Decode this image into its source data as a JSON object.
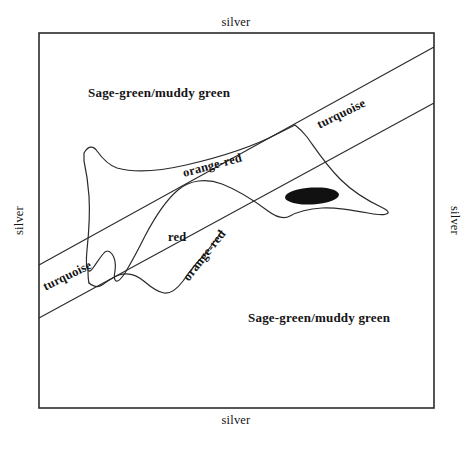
{
  "figure": {
    "background_color": "#ffffff",
    "ink_color": "#141414",
    "frame": {
      "name": "outer-frame",
      "x": 39,
      "y": 33,
      "width": 395,
      "height": 375,
      "stroke_color": "#2b2b2b",
      "stroke_width": 1.6,
      "fill": "none"
    }
  },
  "edge_labels": {
    "top": "silver",
    "bottom": "silver",
    "left": "silver",
    "right": "silver"
  },
  "regions": {
    "sage_top": "Sage-green/muddy green",
    "sage_bottom": "Sage-green/muddy green",
    "turquoise_top": "turquoise",
    "turquoise_bottom": "turquoise",
    "orange_red_top": "orange-red",
    "orange_red_bottom": "orange-red",
    "red_center": "red"
  },
  "band": {
    "name": "turquoise-diagonal-band",
    "description": "diagonal band running from lower-left edge to upper-right edge",
    "angle_degrees": -26,
    "upper_line": {
      "x1": 39,
      "y1": 265,
      "x2": 434,
      "y2": 47
    },
    "lower_line": {
      "x1": 39,
      "y1": 318,
      "x2": 434,
      "y2": 103
    },
    "stroke_color": "#2b2b2b",
    "stroke_width": 1.1
  },
  "blob": {
    "name": "central-irregular-region",
    "fill": "none",
    "stroke_color": "#2b2b2b",
    "stroke_width": 1.2,
    "path": "M 84 153 C 88 146 93 145 97 151 C 102 158 108 165 117 168 C 135 173 160 171 186 165 C 221 157 254 146 277 134 C 285 130 291 127 295 125 C 299 128 303 132 307 137 C 315 148 325 164 340 179 C 352 191 368 201 383 208 C 387 210 389 212 388 213 C 386 215 378 215 368 213 C 352 210 336 207 322 208 C 308 209 297 212 290 216 C 283 220 276 217 268 211 C 256 202 240 191 222 184 C 206 178 190 180 178 190 C 166 200 155 217 145 236 C 138 250 131 263 125 273 C 121 279 118 282 116 281 C 114 280 114 276 115 271 C 116 264 115 258 112 254 C 109 250 106 250 103 254 C 99 259 96 264 93 268 C 91 271 89 272 88 270 C 86 267 86 260 87 250 C 89 231 90 212 89 196 C 88 182 86 170 84 161 Z"
  },
  "blob_lower_boundary": {
    "name": "blob-lower-boundary",
    "path": "M 89 283 C 94 287 98 288 102 285 C 108 281 113 277 119 275 C 128 272 137 275 145 282 C 152 288 158 292 164 293 C 171 294 177 289 183 281 C 190 271 197 262 205 254",
    "stroke_color": "#2b2b2b",
    "stroke_width": 1.2
  },
  "black_spot": {
    "name": "solid-black-ellipse",
    "cx": 312,
    "cy": 196,
    "rx": 27,
    "ry": 8.5,
    "rotation_degrees": -3,
    "fill": "#111111"
  }
}
